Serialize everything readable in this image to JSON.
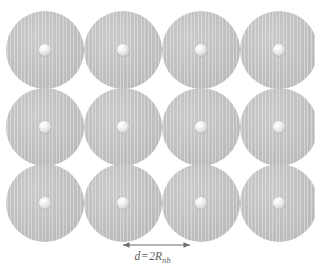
{
  "figure": {
    "background_color": "#ffffff",
    "width": 315,
    "height": 271
  },
  "lattice": {
    "rows": 3,
    "columns": 4,
    "disk_diameter": 78,
    "spacing": 78,
    "disk_color": "#c4c4c4",
    "core_color": "#f0f0f0",
    "core_diameter": 12,
    "column_centers_x": [
      45,
      123,
      201,
      279
    ],
    "row_centers_y": [
      50,
      127,
      203
    ],
    "cells": [
      {
        "row": 0,
        "col": 0
      },
      {
        "row": 0,
        "col": 1
      },
      {
        "row": 0,
        "col": 2
      },
      {
        "row": 0,
        "col": 3
      },
      {
        "row": 1,
        "col": 0
      },
      {
        "row": 1,
        "col": 1
      },
      {
        "row": 1,
        "col": 2
      },
      {
        "row": 1,
        "col": 3
      },
      {
        "row": 2,
        "col": 0
      },
      {
        "row": 2,
        "col": 1
      },
      {
        "row": 2,
        "col": 2
      },
      {
        "row": 2,
        "col": 3
      }
    ]
  },
  "annotation": {
    "dimension": {
      "label_prefix": "d",
      "label_equals": "=",
      "label_value": "2R",
      "label_subscript": "nb",
      "label_full": "d = 2Rₙₙ",
      "arrow_start_x": 123,
      "arrow_end_x": 190,
      "arrow_y": 245,
      "arrow_color": "#6e6e6e",
      "text_color": "#5a5a5a"
    }
  }
}
